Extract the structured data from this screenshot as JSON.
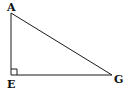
{
  "diagram": {
    "type": "right-triangle",
    "vertices": {
      "A": {
        "label": "A"
      },
      "E": {
        "label": "E"
      },
      "G": {
        "label": "G"
      }
    },
    "right_angle_at": "E",
    "sides": [
      "AE",
      "EG",
      "AG"
    ],
    "colors": {
      "stroke": "#1a1a1a",
      "background": "#ffffff"
    }
  }
}
